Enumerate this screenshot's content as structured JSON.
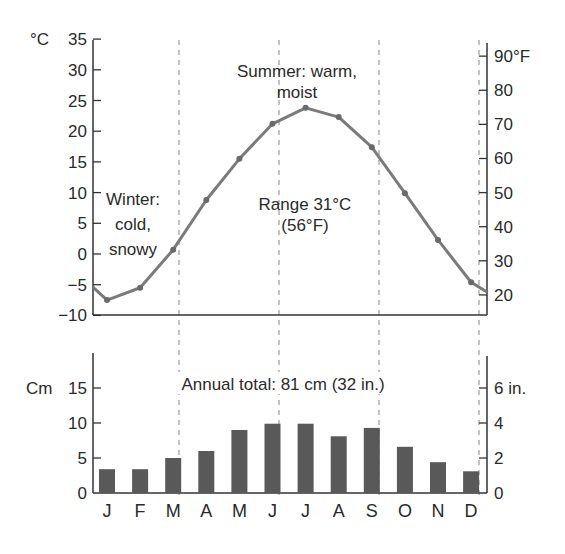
{
  "chart_data": [
    {
      "type": "line",
      "title": "",
      "xlabel": "",
      "ylabel": "°C",
      "y2label": "°F",
      "categories": [
        "J",
        "F",
        "M",
        "A",
        "M",
        "J",
        "J",
        "A",
        "S",
        "O",
        "N",
        "D"
      ],
      "series": [
        {
          "name": "Temperature (°C)",
          "values": [
            -7.5,
            -5.5,
            0.7,
            8.8,
            15.5,
            21.2,
            23.8,
            22.3,
            17.4,
            9.9,
            2.3,
            -4.6
          ],
          "color": "#7a7a7a"
        }
      ],
      "ylim": [
        -10,
        35
      ],
      "yticks": [
        -10,
        -5,
        0,
        5,
        10,
        15,
        20,
        25,
        30,
        35
      ],
      "y2ticks": [
        20,
        30,
        40,
        50,
        60,
        70,
        80,
        90
      ],
      "y2tick_labels": [
        "20",
        "30",
        "40",
        "50",
        "60",
        "70",
        "80",
        "90°F"
      ],
      "grid": false,
      "annotations": [
        {
          "text": [
            "Summer: warm,",
            "moist"
          ]
        },
        {
          "text": [
            "Winter:",
            "cold,",
            "snowy"
          ]
        },
        {
          "text": [
            "Range 31°C",
            "(56°F)"
          ]
        }
      ]
    },
    {
      "type": "bar",
      "title": "",
      "xlabel": "",
      "ylabel": "Cm",
      "y2label": "in.",
      "categories": [
        "J",
        "F",
        "M",
        "A",
        "M",
        "J",
        "J",
        "A",
        "S",
        "O",
        "N",
        "D"
      ],
      "values": [
        3.4,
        3.4,
        5.0,
        6.0,
        9.0,
        9.9,
        9.9,
        8.1,
        9.3,
        6.6,
        4.4,
        3.1
      ],
      "color": "#595959",
      "ylim": [
        0,
        20
      ],
      "yticks": [
        0,
        5,
        10,
        15
      ],
      "y2ticks": [
        0,
        2,
        4,
        6
      ],
      "y2tick_labels": [
        "0",
        "2",
        "4",
        "6 in."
      ],
      "grid": false,
      "annotations": [
        {
          "text": [
            "Annual total: 81 cm (32 in.)"
          ]
        }
      ]
    }
  ],
  "labels": {
    "temp_unit": "°C",
    "precip_unit": "Cm",
    "summer": [
      "Summer: warm,",
      "moist"
    ],
    "winter": [
      "Winter:",
      "cold,",
      "snowy"
    ],
    "range": [
      "Range 31°C",
      "(56°F)"
    ],
    "annual_total": "Annual total: 81 cm (32 in.)"
  },
  "colors": {
    "line": "#7a7a7a",
    "bar": "#595959",
    "axis": "#333333",
    "dash": "#9a9a9a",
    "text": "#2a2a2a"
  }
}
